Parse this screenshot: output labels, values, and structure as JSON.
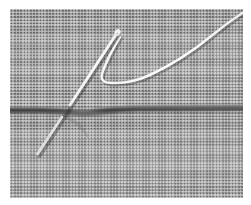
{
  "figure": {
    "alt_text": "Close-up grayscale photograph of a sewing needle pushed through a woven gray fabric along a dark horizontal seam, with a white thread looping upward and trailing off to the upper right corner",
    "media_type": "photograph",
    "color_mode": "grayscale"
  },
  "canvas": {
    "width": 251,
    "height": 205,
    "background_color": "#ffffff",
    "photo_left": 10,
    "photo_top": 9,
    "photo_width": 233,
    "photo_height": 189
  },
  "colors": {
    "paper_white": "#ffffff",
    "fabric_mid_gray": "#9a9a9a",
    "fabric_light_weave": "#c2c2c2",
    "fabric_dark_weave": "#7b7b7b",
    "seam_dark": "#3a3a3a",
    "seam_shadow": "#585858",
    "thread_white": "#f4f4f4",
    "thread_edge": "#d8d8d8",
    "needle_steel": "#efefef"
  },
  "scene": {
    "fabric": {
      "label": "woven fabric",
      "weave_cell_px": 3.2,
      "weave_type": "plain weave checkerboard"
    },
    "seam": {
      "label": "dark horizontal seam line",
      "y_position": 99,
      "thickness_px": 5,
      "orientation": "horizontal",
      "dip_note": "seam dips slightly downward on the left third"
    },
    "needle": {
      "label": "sewing needle",
      "eye_end_x": 106,
      "eye_end_y": 25,
      "tip_x": 27,
      "tip_y": 144,
      "angle_deg": -58,
      "note": "needle crosses the seam at the midpoint and emerges below"
    },
    "thread": {
      "label": "white thread",
      "loop_bottom_x": 95,
      "loop_bottom_y": 69,
      "exit_x": 233,
      "exit_y": 2,
      "note": "thread loops down from the needle eye and trails to the upper right corner"
    }
  },
  "annotations": {
    "needle_label": "needle",
    "thread_label": "thread",
    "seam_label": "seam",
    "fabric_label": "fabric"
  }
}
